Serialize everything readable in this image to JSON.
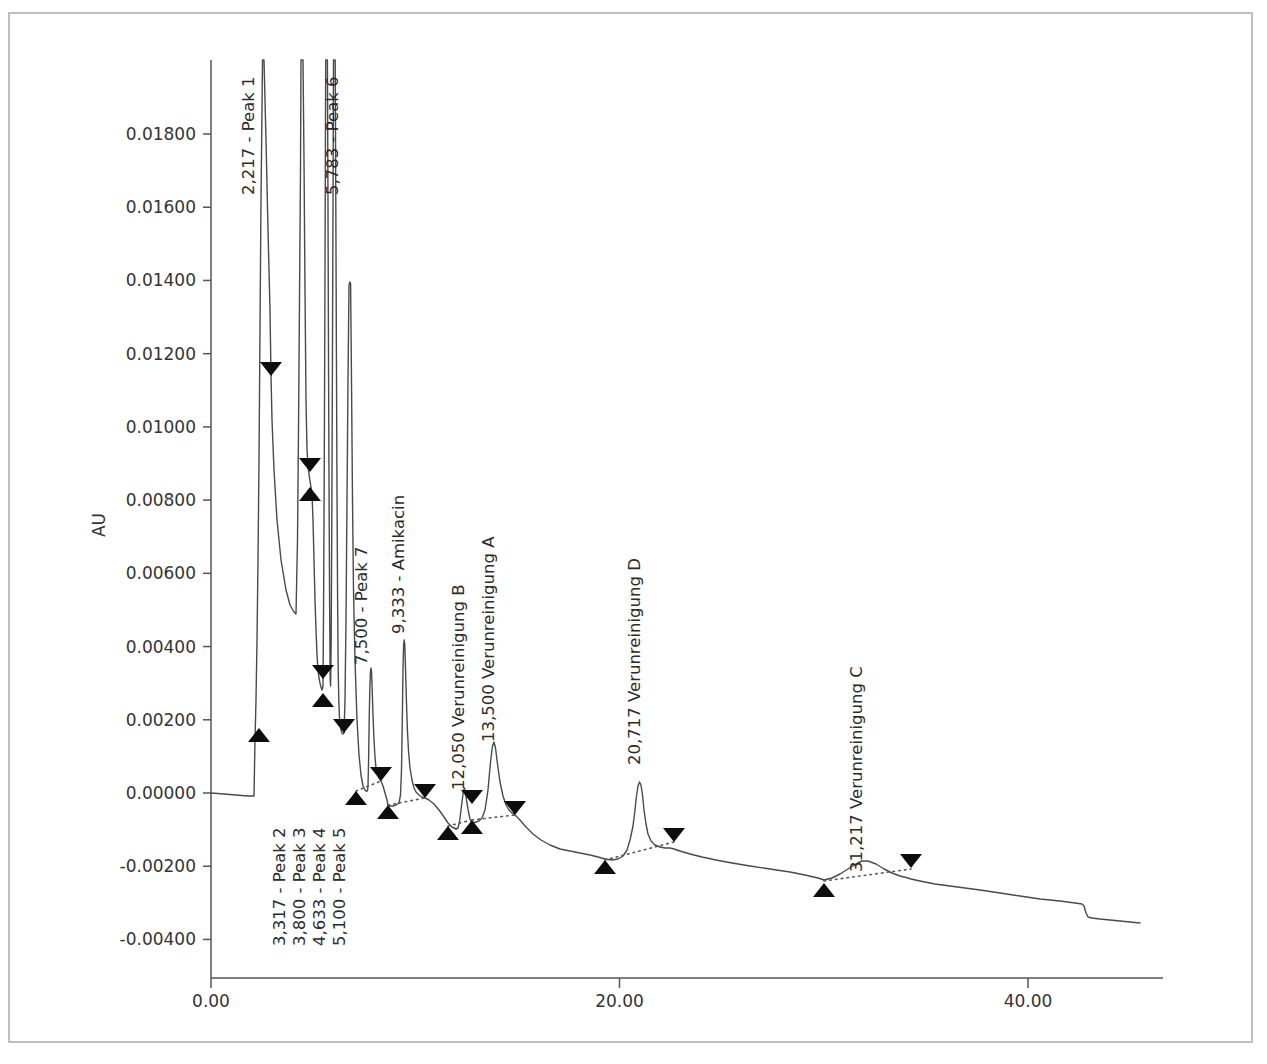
{
  "chart_data": {
    "type": "line",
    "title": "",
    "xlabel": "",
    "ylabel": "AU",
    "xlim": [
      -0.55,
      46.5
    ],
    "ylim": [
      -0.0052,
      0.0199
    ],
    "grid": false,
    "legend": "none",
    "x_ticks": [
      {
        "value": 0,
        "label": "0.00"
      },
      {
        "value": 20,
        "label": "20.00"
      },
      {
        "value": 40,
        "label": "40.00"
      }
    ],
    "y_ticks": [
      {
        "value": 0.018,
        "label": "0.01800"
      },
      {
        "value": 0.016,
        "label": "0.01600"
      },
      {
        "value": 0.014,
        "label": "0.01400"
      },
      {
        "value": 0.012,
        "label": "0.01200"
      },
      {
        "value": 0.01,
        "label": "0.01000"
      },
      {
        "value": 0.008,
        "label": "0.00800"
      },
      {
        "value": 0.006,
        "label": "0.00600"
      },
      {
        "value": 0.004,
        "label": "0.00400"
      },
      {
        "value": 0.002,
        "label": "0.00200"
      },
      {
        "value": 0.0,
        "label": "0.00000"
      },
      {
        "value": -0.002,
        "label": "-0.00200"
      },
      {
        "value": -0.004,
        "label": "-0.00400"
      }
    ],
    "peak_labels": [
      {
        "id": "peak-1",
        "text": "2,217 - Peak 1",
        "rt": 2.217,
        "x_px": 254,
        "y_px_bottom": 195,
        "orientation": "vertical"
      },
      {
        "id": "peak-6",
        "text": "5,783 - Peak 6",
        "rt": 5.783,
        "x_px": 338,
        "y_px_bottom": 195,
        "orientation": "vertical"
      },
      {
        "id": "peak-7",
        "text": "7,500 - Peak 7",
        "rt": 7.5,
        "x_px": 367,
        "y_px_bottom": 665,
        "orientation": "vertical"
      },
      {
        "id": "amikacin",
        "text": "9,333 - Amikacin",
        "rt": 9.333,
        "x_px": 404,
        "y_px_bottom": 634,
        "orientation": "vertical"
      },
      {
        "id": "verunreinigung-b",
        "text": "12,050 Verunreinigung B",
        "rt": 12.05,
        "x_px": 464,
        "y_px_bottom": 790,
        "orientation": "vertical"
      },
      {
        "id": "verunreinigung-a",
        "text": "13,500 Verunreinigung A",
        "rt": 13.5,
        "x_px": 494,
        "y_px_bottom": 742,
        "orientation": "vertical"
      },
      {
        "id": "verunreinigung-d",
        "text": "20,717 Verunreinigung D",
        "rt": 20.717,
        "x_px": 640,
        "y_px_bottom": 765,
        "orientation": "vertical"
      },
      {
        "id": "verunreinigung-c",
        "text": "31,217 Verunreinigung C",
        "rt": 31.217,
        "x_px": 862,
        "y_px_bottom": 872,
        "orientation": "vertical"
      },
      {
        "id": "peak-2",
        "text": "3,317 - Peak 2",
        "rt": 3.317,
        "x_px": 285,
        "y_px_bottom": 946,
        "orientation": "vertical"
      },
      {
        "id": "peak-3",
        "text": "3,800 - Peak 3",
        "rt": 3.8,
        "x_px": 305,
        "y_px_bottom": 946,
        "orientation": "vertical"
      },
      {
        "id": "peak-4",
        "text": "4,633 - Peak 4",
        "rt": 4.633,
        "x_px": 325,
        "y_px_bottom": 946,
        "orientation": "vertical"
      },
      {
        "id": "peak-5",
        "text": "5,100 - Peak 5",
        "rt": 5.1,
        "x_px": 345,
        "y_px_bottom": 946,
        "orientation": "vertical"
      }
    ],
    "peaks": [
      {
        "name": "Peak 1",
        "rt": 2.217,
        "apex_au": 0.028,
        "clipped": true
      },
      {
        "name": "Peak 2",
        "rt": 3.317,
        "apex_au": 0.026,
        "clipped": true
      },
      {
        "name": "Peak 3",
        "rt": 3.8,
        "apex_au": 0.026,
        "clipped": true
      },
      {
        "name": "Peak 4",
        "rt": 4.633,
        "apex_au": 0.025,
        "clipped": true
      },
      {
        "name": "Peak 5",
        "rt": 5.1,
        "apex_au": 0.025,
        "clipped": true
      },
      {
        "name": "Peak 6",
        "rt": 5.783,
        "apex_au": 0.014,
        "clipped": false
      },
      {
        "name": "Peak 7",
        "rt": 7.5,
        "apex_au": 0.0033,
        "clipped": false
      },
      {
        "name": "Amikacin",
        "rt": 9.333,
        "apex_au": 0.00425,
        "clipped": false
      },
      {
        "name": "Verunreinigung B",
        "rt": 12.05,
        "apex_au": 0.0004,
        "clipped": false
      },
      {
        "name": "Verunreinigung A",
        "rt": 13.5,
        "apex_au": 0.0014,
        "clipped": false
      },
      {
        "name": "Verunreinigung D",
        "rt": 20.717,
        "apex_au": 0.00065,
        "clipped": false
      },
      {
        "name": "Verunreinigung C",
        "rt": 31.217,
        "apex_au": -0.00165,
        "clipped": false
      }
    ],
    "markers": [
      {
        "type": "up",
        "x_px": 259,
        "y_px": 728
      },
      {
        "type": "down",
        "x_px": 271,
        "y_px": 376
      },
      {
        "type": "down",
        "x_px": 310,
        "y_px": 472
      },
      {
        "type": "up",
        "x_px": 310,
        "y_px": 487
      },
      {
        "type": "down",
        "x_px": 323,
        "y_px": 679
      },
      {
        "type": "up",
        "x_px": 323,
        "y_px": 693
      },
      {
        "type": "down",
        "x_px": 344,
        "y_px": 733
      },
      {
        "type": "up",
        "x_px": 356,
        "y_px": 791
      },
      {
        "type": "down",
        "x_px": 381,
        "y_px": 781
      },
      {
        "type": "up",
        "x_px": 388,
        "y_px": 805
      },
      {
        "type": "down",
        "x_px": 425,
        "y_px": 798
      },
      {
        "type": "up",
        "x_px": 448,
        "y_px": 826
      },
      {
        "type": "down",
        "x_px": 472,
        "y_px": 804
      },
      {
        "type": "up",
        "x_px": 472,
        "y_px": 820
      },
      {
        "type": "down",
        "x_px": 515,
        "y_px": 815
      },
      {
        "type": "up",
        "x_px": 605,
        "y_px": 860
      },
      {
        "type": "down",
        "x_px": 674,
        "y_px": 842
      },
      {
        "type": "up",
        "x_px": 824,
        "y_px": 883
      },
      {
        "type": "down",
        "x_px": 911,
        "y_px": 868
      }
    ]
  },
  "axes": {
    "y_title": "AU"
  }
}
